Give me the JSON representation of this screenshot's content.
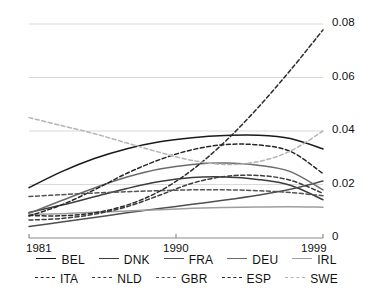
{
  "chart_data": {
    "type": "line",
    "title": "",
    "subtitle": "",
    "xlabel": "",
    "ylabel": "",
    "xlim": [
      1981,
      1999
    ],
    "ylim": [
      0,
      0.08
    ],
    "grid": "horizontal",
    "x_ticks": [
      "1981",
      "1990",
      "1999"
    ],
    "x_tick_values": [
      1981,
      1990,
      1999
    ],
    "y_ticks": [
      "0",
      "0.02",
      "0.04",
      "0.06",
      "0.08"
    ],
    "y_tick_values": [
      0,
      0.02,
      0.04,
      0.06,
      0.08
    ],
    "legend_position": "bottom",
    "x": [
      1981,
      1983,
      1985,
      1987,
      1989,
      1991,
      1993,
      1995,
      1997,
      1999
    ],
    "series": [
      {
        "name": "BEL",
        "style": "solid",
        "color": "#1a1a1a",
        "values": [
          0.0188,
          0.0248,
          0.0297,
          0.0334,
          0.036,
          0.0375,
          0.0383,
          0.0384,
          0.0372,
          0.0333
        ]
      },
      {
        "name": "DNK",
        "style": "solid",
        "color": "#3d3d3d",
        "values": [
          0.0095,
          0.0123,
          0.0154,
          0.0185,
          0.0211,
          0.0226,
          0.0228,
          0.0219,
          0.0197,
          0.0143
        ]
      },
      {
        "name": "FRA",
        "style": "solid",
        "color": "#4f4f4f",
        "values": [
          0.0043,
          0.006,
          0.0077,
          0.0094,
          0.011,
          0.0126,
          0.0142,
          0.016,
          0.0182,
          0.0213
        ]
      },
      {
        "name": "DEU",
        "style": "solid",
        "color": "#6b6b6b",
        "values": [
          0.0092,
          0.014,
          0.0187,
          0.0228,
          0.0258,
          0.0275,
          0.028,
          0.0272,
          0.0248,
          0.018
        ]
      },
      {
        "name": "IRL",
        "style": "solid",
        "color": "#9e9e9e",
        "values": [
          0.0088,
          0.0091,
          0.0096,
          0.0101,
          0.0106,
          0.0111,
          0.0114,
          0.0116,
          0.0117,
          0.0115
        ]
      },
      {
        "name": "ITA",
        "style": "dashed",
        "color": "#262626",
        "values": [
          0.0082,
          0.0124,
          0.018,
          0.0242,
          0.0293,
          0.033,
          0.0349,
          0.0348,
          0.0324,
          0.0241
        ]
      },
      {
        "name": "NLD",
        "style": "dashed",
        "color": "#3d3d3d",
        "values": [
          0.0067,
          0.0073,
          0.0089,
          0.0117,
          0.016,
          0.0205,
          0.023,
          0.0234,
          0.0216,
          0.0167
        ]
      },
      {
        "name": "GBR",
        "style": "dashed",
        "color": "#555555",
        "values": [
          0.0155,
          0.0162,
          0.0168,
          0.0173,
          0.0177,
          0.018,
          0.018,
          0.0177,
          0.017,
          0.0158
        ]
      },
      {
        "name": "ESP",
        "style": "dashed",
        "color": "#2b2b2b",
        "values": [
          0.0084,
          0.0083,
          0.0094,
          0.0123,
          0.0175,
          0.0255,
          0.036,
          0.0486,
          0.0627,
          0.0778
        ]
      },
      {
        "name": "SWE",
        "style": "dashed",
        "color": "#b5b5b5",
        "values": [
          0.045,
          0.042,
          0.039,
          0.0355,
          0.032,
          0.029,
          0.0275,
          0.0285,
          0.0325,
          0.04
        ]
      }
    ]
  },
  "legend": {
    "rows": [
      [
        {
          "label": "BEL",
          "style": "solid",
          "color": "#1a1a1a"
        },
        {
          "label": "DNK",
          "style": "solid",
          "color": "#3d3d3d"
        },
        {
          "label": "FRA",
          "style": "solid",
          "color": "#4f4f4f"
        },
        {
          "label": "DEU",
          "style": "solid",
          "color": "#6b6b6b"
        },
        {
          "label": "IRL",
          "style": "solid",
          "color": "#9e9e9e"
        }
      ],
      [
        {
          "label": "ITA",
          "style": "dashed",
          "color": "#262626"
        },
        {
          "label": "NLD",
          "style": "dashed",
          "color": "#3d3d3d"
        },
        {
          "label": "GBR",
          "style": "dashed",
          "color": "#555555"
        },
        {
          "label": "ESP",
          "style": "dashed",
          "color": "#2b2b2b"
        },
        {
          "label": "SWE",
          "style": "dashed",
          "color": "#b5b5b5"
        }
      ]
    ]
  },
  "colors": {
    "gridline": "#d9d9d9",
    "axis": "#8c8c8c",
    "text": "#111111",
    "background": "#ffffff"
  }
}
